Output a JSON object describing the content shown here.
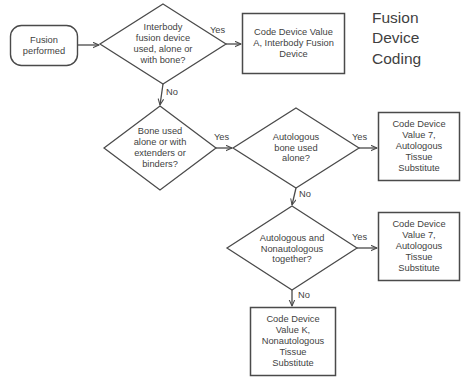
{
  "title": "Fusion\nDevice\nCoding",
  "colors": {
    "background": "#ffffff",
    "stroke": "#4a4a4a",
    "text": "#3f3f3f"
  },
  "nodes": {
    "start": {
      "shape": "rounded-rectangle",
      "label": "Fusion\nperformed"
    },
    "decision_interbody": {
      "shape": "diamond",
      "label": "Interbody\nfusion device\nused, alone or\nwith bone?"
    },
    "decision_bone": {
      "shape": "diamond",
      "label": "Bone used\nalone or with\nextenders or\nbinders?"
    },
    "decision_autologous_alone": {
      "shape": "diamond",
      "label": "Autologous\nbone used\nalone?"
    },
    "decision_autologous_and_nonautologous": {
      "shape": "diamond",
      "label": "Autologous and\nNonautologous\ntogether?"
    },
    "result_interbody": {
      "shape": "rectangle",
      "label": "Code Device Value\nA, Interbody Fusion\nDevice"
    },
    "result_autologous_1": {
      "shape": "rectangle",
      "label": "Code Device\nValue 7,\nAutologous\nTissue\nSubstitute"
    },
    "result_autologous_2": {
      "shape": "rectangle",
      "label": "Code Device\nValue 7,\nAutologous\nTissue\nSubstitute"
    },
    "result_nonautologous": {
      "shape": "rectangle",
      "label": "Code Device\nValue K,\nNonautologous\nTissue\nSubstitute"
    }
  },
  "edges": {
    "start_to_interbody": "",
    "interbody_yes": "Yes",
    "interbody_no": "No",
    "bone_yes": "Yes",
    "autologous_alone_yes": "Yes",
    "autologous_alone_no": "No",
    "autologous_both_yes": "Yes",
    "autologous_both_no": "No"
  }
}
